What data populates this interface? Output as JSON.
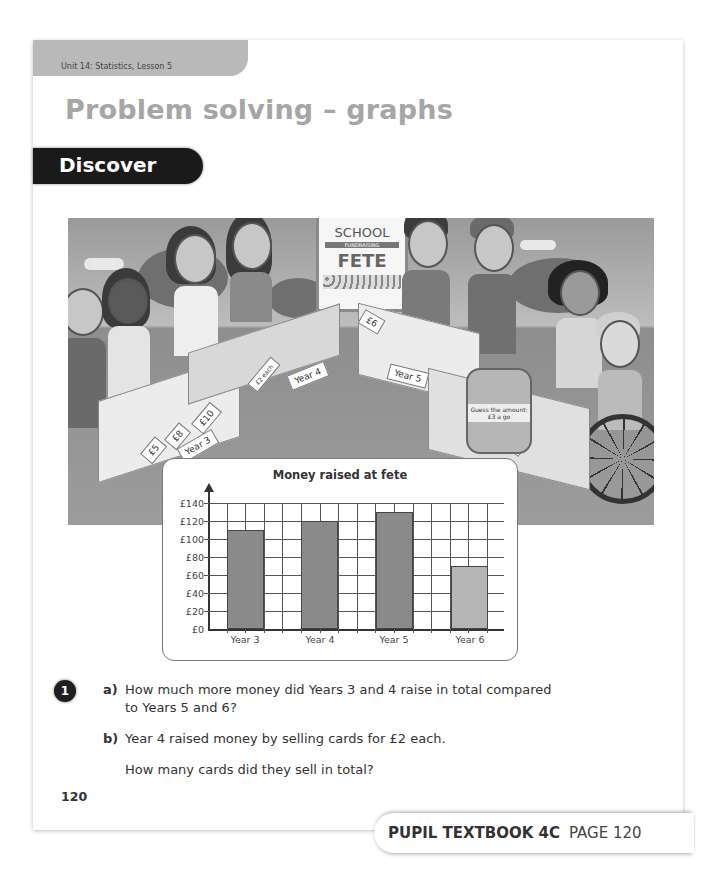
{
  "header": {
    "unit_label": "Unit 14: Statistics, Lesson 5",
    "title": "Problem solving – graphs",
    "section": "Discover"
  },
  "illustration": {
    "sign": {
      "line1": "SCHOOL",
      "line2": "FUNDRAISING",
      "line3": "FETE"
    },
    "stall_labels": [
      "Year 3",
      "Year 4",
      "Year 5",
      "Year 6"
    ],
    "price_tags": [
      "£5",
      "£8",
      "£10",
      "£2 each",
      "£6"
    ],
    "jar_label": "Guess the amount: £3 a go"
  },
  "chart_data": {
    "type": "bar",
    "title": "Money raised at fete",
    "categories": [
      "Year 3",
      "Year 4",
      "Year 5",
      "Year 6"
    ],
    "values": [
      110,
      120,
      130,
      70
    ],
    "xlabel": "",
    "ylabel": "",
    "yticks": [
      "£0",
      "£20",
      "£40",
      "£60",
      "£80",
      "£100",
      "£120",
      "£140"
    ],
    "ylim": [
      0,
      140
    ],
    "grid": true,
    "bar_colors": [
      "#8a8a8a",
      "#8a8a8a",
      "#8a8a8a",
      "#b5b5b5"
    ],
    "legend": null
  },
  "questions": {
    "number": "1",
    "a_label": "a)",
    "a_line1": "How much more money did Years 3 and 4 raise in total compared",
    "a_line2": "to Years 5 and 6?",
    "b_label": "b)",
    "b_line1": "Year 4 raised money by selling cards for £2 each.",
    "b_line2": "How many cards did they sell in total?"
  },
  "page_number": "120",
  "footer": {
    "book": "PUPIL TEXTBOOK 4C",
    "page": "PAGE 120"
  }
}
